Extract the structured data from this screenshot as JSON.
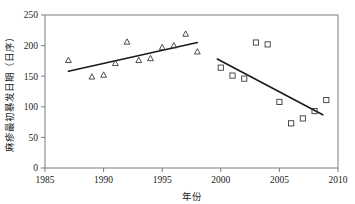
{
  "chart_data": {
    "type": "scatter",
    "title": "",
    "xlabel": "年份",
    "ylabel": "麻疹最初暴发日期（日序）",
    "xlim": [
      1985,
      2010
    ],
    "ylim": [
      0,
      250
    ],
    "xticks": [
      1985,
      1990,
      1995,
      2000,
      2005,
      2010
    ],
    "yticks": [
      0,
      50,
      100,
      150,
      200,
      250
    ],
    "xtick_labels": [
      "1985",
      "1990",
      "1995",
      "2000",
      "2005",
      "2010"
    ],
    "ytick_labels": [
      "0",
      "50",
      "100",
      "150",
      "200",
      "250"
    ],
    "grid": false,
    "legend": "none",
    "series": [
      {
        "name": "1987-1998",
        "marker": "triangle",
        "color": "#3a3a3a",
        "points": [
          {
            "x": 1987,
            "y": 176
          },
          {
            "x": 1989,
            "y": 149
          },
          {
            "x": 1990,
            "y": 152
          },
          {
            "x": 1991,
            "y": 171
          },
          {
            "x": 1992,
            "y": 206
          },
          {
            "x": 1993,
            "y": 176
          },
          {
            "x": 1994,
            "y": 179
          },
          {
            "x": 1995,
            "y": 197
          },
          {
            "x": 1996,
            "y": 200
          },
          {
            "x": 1997,
            "y": 219
          },
          {
            "x": 1998,
            "y": 190
          }
        ],
        "trend": {
          "x1": 1987.0,
          "y1": 158,
          "x2": 1998.0,
          "y2": 205
        }
      },
      {
        "name": "2000-2009",
        "marker": "square",
        "color": "#3a3a3a",
        "points": [
          {
            "x": 2000,
            "y": 164
          },
          {
            "x": 2001,
            "y": 151
          },
          {
            "x": 2002,
            "y": 146
          },
          {
            "x": 2003,
            "y": 205
          },
          {
            "x": 2004,
            "y": 202
          },
          {
            "x": 2005,
            "y": 108
          },
          {
            "x": 2006,
            "y": 73
          },
          {
            "x": 2007,
            "y": 81
          },
          {
            "x": 2008,
            "y": 93
          },
          {
            "x": 2009,
            "y": 111
          }
        ],
        "trend": {
          "x1": 1999.7,
          "y1": 178,
          "x2": 2008.7,
          "y2": 87
        }
      }
    ]
  }
}
